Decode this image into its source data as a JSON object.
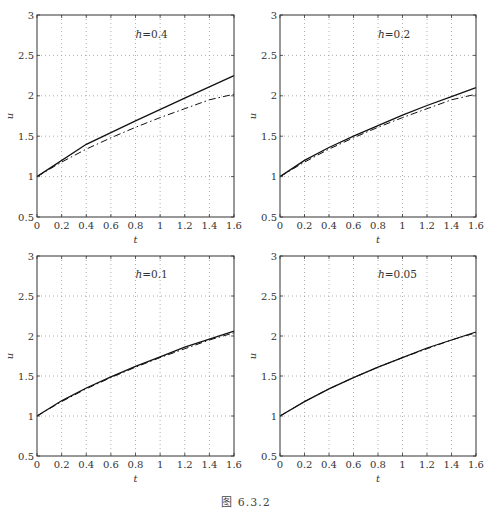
{
  "figure": {
    "caption": "图 6.3.2"
  },
  "chart_data": [
    {
      "type": "line",
      "panel": "top-left",
      "annotation": "h=0.4",
      "h_symbol": "h",
      "h_value": "=0.4",
      "xlabel": "t",
      "ylabel": "u",
      "xlim": [
        0,
        1.6
      ],
      "ylim": [
        0.5,
        3
      ],
      "xticks": [
        "0",
        "0.2",
        "0.4",
        "0.6",
        "0.8",
        "1",
        "1.2",
        "1.4",
        "1.6"
      ],
      "yticks": [
        "0.5",
        "1",
        "1.5",
        "2",
        "2.5",
        "3"
      ],
      "grid": true,
      "series": [
        {
          "name": "solid",
          "style": "solid",
          "x": [
            0,
            0.4,
            0.8,
            1.2,
            1.6
          ],
          "values": [
            1.0,
            1.4,
            1.69,
            1.97,
            2.25
          ]
        },
        {
          "name": "dash-dot",
          "style": "dashdot",
          "x": [
            0,
            0.2,
            0.4,
            0.6,
            0.8,
            1.0,
            1.2,
            1.4,
            1.6
          ],
          "values": [
            1.0,
            1.18,
            1.34,
            1.48,
            1.61,
            1.73,
            1.84,
            1.95,
            2.02
          ]
        }
      ]
    },
    {
      "type": "line",
      "panel": "top-right",
      "annotation": "h=0.2",
      "h_symbol": "h",
      "h_value": "=0.2",
      "xlabel": "t",
      "ylabel": "u",
      "xlim": [
        0,
        1.6
      ],
      "ylim": [
        0.5,
        3
      ],
      "xticks": [
        "0",
        "0.2",
        "0.4",
        "0.6",
        "0.8",
        "1",
        "1.2",
        "1.4",
        "1.6"
      ],
      "yticks": [
        "0.5",
        "1",
        "1.5",
        "2",
        "2.5",
        "3"
      ],
      "grid": true,
      "series": [
        {
          "name": "solid",
          "style": "solid",
          "x": [
            0,
            0.2,
            0.4,
            0.6,
            0.8,
            1.0,
            1.2,
            1.4,
            1.6
          ],
          "values": [
            1.0,
            1.2,
            1.36,
            1.5,
            1.63,
            1.76,
            1.88,
            1.99,
            2.1
          ]
        },
        {
          "name": "dash-dot",
          "style": "dashdot",
          "x": [
            0,
            0.2,
            0.4,
            0.6,
            0.8,
            1.0,
            1.2,
            1.4,
            1.6
          ],
          "values": [
            1.0,
            1.18,
            1.34,
            1.48,
            1.61,
            1.73,
            1.84,
            1.95,
            2.02
          ]
        }
      ]
    },
    {
      "type": "line",
      "panel": "bottom-left",
      "annotation": "h=0.1",
      "h_symbol": "h",
      "h_value": "=0.1",
      "xlabel": "t",
      "ylabel": "u",
      "xlim": [
        0,
        1.6
      ],
      "ylim": [
        0.5,
        3
      ],
      "xticks": [
        "0",
        "0.2",
        "0.4",
        "0.6",
        "0.8",
        "1",
        "1.2",
        "1.4",
        "1.6"
      ],
      "yticks": [
        "0.5",
        "1",
        "1.5",
        "2",
        "2.5",
        "3"
      ],
      "grid": true,
      "series": [
        {
          "name": "solid",
          "style": "solid",
          "x": [
            0,
            0.2,
            0.4,
            0.6,
            0.8,
            1.0,
            1.2,
            1.4,
            1.6
          ],
          "values": [
            1.0,
            1.19,
            1.35,
            1.49,
            1.62,
            1.74,
            1.86,
            1.96,
            2.06
          ]
        },
        {
          "name": "dash-dot",
          "style": "dashdot",
          "x": [
            0,
            0.2,
            0.4,
            0.6,
            0.8,
            1.0,
            1.2,
            1.4,
            1.6
          ],
          "values": [
            1.0,
            1.18,
            1.34,
            1.48,
            1.61,
            1.73,
            1.84,
            1.95,
            2.04
          ]
        }
      ]
    },
    {
      "type": "line",
      "panel": "bottom-right",
      "annotation": "h=0.05",
      "h_symbol": "h",
      "h_value": "=0.05",
      "xlabel": "t",
      "ylabel": "u",
      "xlim": [
        0,
        1.6
      ],
      "ylim": [
        0.5,
        3
      ],
      "xticks": [
        "0",
        "0.2",
        "0.4",
        "0.6",
        "0.8",
        "1",
        "1.2",
        "1.4",
        "1.6"
      ],
      "yticks": [
        "0.5",
        "1",
        "1.5",
        "2",
        "2.5",
        "3"
      ],
      "grid": true,
      "series": [
        {
          "name": "solid",
          "style": "solid",
          "x": [
            0,
            0.2,
            0.4,
            0.6,
            0.8,
            1.0,
            1.2,
            1.4,
            1.6
          ],
          "values": [
            1.0,
            1.18,
            1.34,
            1.48,
            1.61,
            1.73,
            1.85,
            1.95,
            2.05
          ]
        },
        {
          "name": "dash-dot",
          "style": "dashdot",
          "x": [
            0,
            0.2,
            0.4,
            0.6,
            0.8,
            1.0,
            1.2,
            1.4,
            1.6
          ],
          "values": [
            1.0,
            1.18,
            1.34,
            1.48,
            1.61,
            1.73,
            1.84,
            1.95,
            2.04
          ]
        }
      ]
    }
  ]
}
